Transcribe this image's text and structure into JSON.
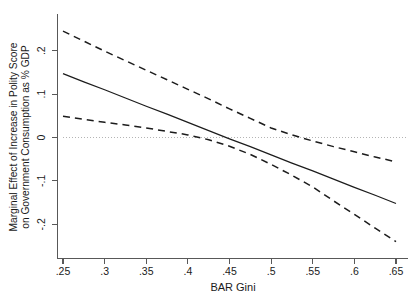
{
  "chart_data": {
    "type": "line",
    "title": "",
    "subtitle": "",
    "xlabel": "BAR Gini",
    "ylabel": "Marginal Effect of Increase in Polity Score on Government Consumption as % GDP",
    "ylabel_lines": [
      "Marginal Effect of Increase in Polity Score",
      "on Government Consumption as % GDP"
    ],
    "xlim": [
      0.25,
      0.65
    ],
    "ylim": [
      -0.25,
      0.25
    ],
    "xticks": [
      0.25,
      0.3,
      0.35,
      0.4,
      0.45,
      0.5,
      0.55,
      0.6,
      0.65
    ],
    "xticklabels": [
      ".25",
      ".3",
      ".35",
      ".4",
      ".45",
      ".5",
      ".55",
      ".6",
      ".65"
    ],
    "yticks": [
      0.2,
      0.1,
      0,
      -0.1,
      -0.2
    ],
    "yticklabels": [
      ".2",
      ".1",
      "0",
      "-.1",
      "-.2"
    ],
    "grid": false,
    "legend": "none",
    "reference_line": {
      "name": "zero-line",
      "orientation": "horizontal",
      "value": 0,
      "style": "dotted",
      "color": "#b4b4b4"
    },
    "x": [
      0.25,
      0.275,
      0.3,
      0.325,
      0.35,
      0.375,
      0.4,
      0.425,
      0.45,
      0.475,
      0.5,
      0.525,
      0.55,
      0.575,
      0.6,
      0.625,
      0.65
    ],
    "series": [
      {
        "name": "Marginal Effect",
        "style": "solid",
        "color": "#1c1c1c",
        "values": [
          0.147,
          0.128,
          0.11,
          0.091,
          0.072,
          0.054,
          0.035,
          0.016,
          -0.003,
          -0.021,
          -0.04,
          -0.059,
          -0.077,
          -0.096,
          -0.115,
          -0.133,
          -0.152
        ]
      },
      {
        "name": "Upper 95% Confidence Interval",
        "style": "dashed",
        "color": "#1c1c1c",
        "values": [
          0.245,
          0.222,
          0.199,
          0.177,
          0.155,
          0.133,
          0.111,
          0.089,
          0.066,
          0.044,
          0.022,
          0.006,
          -0.008,
          -0.021,
          -0.033,
          -0.045,
          -0.056
        ]
      },
      {
        "name": "Lower 95% Confidence Interval",
        "style": "dashed",
        "color": "#1c1c1c",
        "values": [
          0.049,
          0.042,
          0.035,
          0.029,
          0.022,
          0.014,
          0.006,
          -0.005,
          -0.02,
          -0.039,
          -0.062,
          -0.087,
          -0.114,
          -0.146,
          -0.177,
          -0.209,
          -0.24
        ]
      }
    ],
    "annotations": {
      "main_crosses_zero_at": 0.446,
      "upper_ci_crosses_zero_at": 0.504,
      "lower_ci_crosses_zero_at": 0.392
    }
  }
}
